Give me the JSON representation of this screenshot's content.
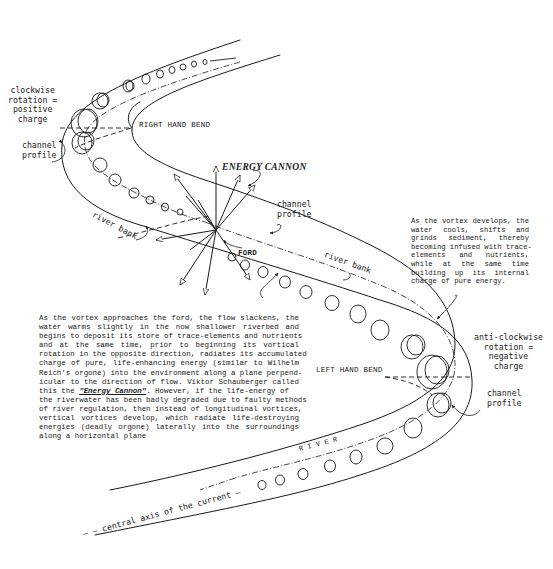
{
  "figure": {
    "type": "river meander vortex diagram",
    "stroke_color": "#1a1a1a",
    "background": "#ffffff"
  },
  "labels": {
    "clockwise": [
      "clockwise",
      "rotation =",
      "positive",
      "charge"
    ],
    "channel_profile_top": [
      "channel",
      "profile"
    ],
    "right_hand_bend": "RIGHT HAND BEND",
    "energy_cannon": "ENERGY CANNON",
    "channel_profile_mid": [
      "channel",
      "profile"
    ],
    "river_bank_left": "river bank",
    "river_bank_right": "river bank",
    "ford": "FORD",
    "anticlockwise": [
      "anti-clockwise",
      "rotation =",
      "negative",
      "charge"
    ],
    "left_hand_bend": "LEFT HAND BEND",
    "channel_profile_bottom": [
      "channel",
      "profile"
    ],
    "river": "R I V E R",
    "central_axis": "central axis of the current"
  },
  "paragraphs": {
    "vortex_develops": [
      "As the vortex develops, the",
      "water  cools,  shifts  and",
      "grinds  sediment,  thereby",
      "becoming infused with trace-",
      "elements   and   nutrients,",
      "while  at  the  same  time",
      "building  up  its  internal",
      "charge of pure energy."
    ],
    "ford_approach": {
      "lines_before": [
        "As the vortex approaches the ford, the flow slackens, the",
        "water  warms  slightly  in  the  now  shallower  riverbed  and",
        "begins to deposit its store of trace-elements and nutrients",
        "and  at  the  same  time,  prior  to  beginning  its  vortical",
        "rotation in the opposite direction, radiates its accumulated",
        "charge  of  pure,  life-enhancing  energy  (similar to Wilhelm",
        "Reich's orgone) into the environment along a plane perpend-",
        "icular to the direction of flow.  Viktor Schauberger called"
      ],
      "line_emph_prefix": "this the ",
      "line_emph": "\"Energy Cannon\"",
      "line_emph_suffix": ".   However, if the life-energy of",
      "lines_after": [
        "the riverwater has been badly degraded due to faulty methods",
        "of river regulation, then instead of longitudinal vortices,",
        "vertical  vortices  develop,  which  radiate  life-destroying",
        "energies  (deadly  orgone)  laterally  into  the  surroundings",
        "along a horizontal plane"
      ]
    }
  }
}
